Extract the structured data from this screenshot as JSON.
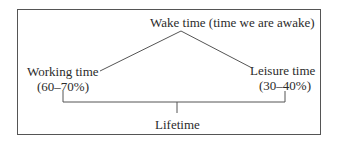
{
  "diagram": {
    "top_node": {
      "label": "Wake time (time we are awake)"
    },
    "left_node": {
      "label": "Working time",
      "share": "(60–70%)"
    },
    "right_node": {
      "label": "Leisure time",
      "share": "(30–40%)"
    },
    "bottom_node": {
      "label": "Lifetime"
    }
  },
  "colors": {
    "line": "#555555",
    "text": "#2b2b2b",
    "background": "#ffffff"
  }
}
